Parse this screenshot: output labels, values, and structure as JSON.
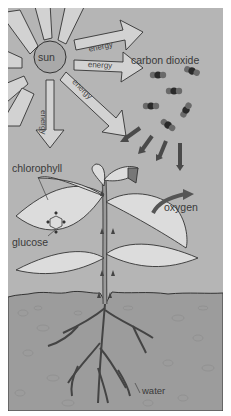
{
  "diagram": {
    "labels": {
      "sun": "sun",
      "energy_1": "energy",
      "energy_2": "energy",
      "energy_3": "energy",
      "energy_4": "energy",
      "carbon_dioxide": "carbon dioxide",
      "chlorophyll": "chlorophyll",
      "glucose": "glucose",
      "oxygen": "oxygen",
      "water": "water"
    },
    "colors": {
      "sky": "#b5b5b5",
      "sun": "#a9a9a9",
      "ray": "#d2d2d2",
      "soil": "#9a9a9a",
      "leaf": "#dcdcdc",
      "stem": "#7a7a7a",
      "molecule_dark": "#2a2a2a",
      "molecule_light": "#6a6a6a",
      "arrow": "#5a5a5a",
      "border": "#ffffff"
    },
    "flows": [
      {
        "from": "sun",
        "to": "leaves",
        "label": "energy"
      },
      {
        "from": "air",
        "to": "leaves",
        "label": "carbon dioxide"
      },
      {
        "from": "leaves",
        "to": "air",
        "label": "oxygen"
      },
      {
        "from": "soil",
        "to": "roots",
        "label": "water"
      }
    ]
  }
}
